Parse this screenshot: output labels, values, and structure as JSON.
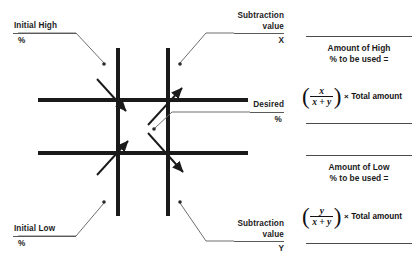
{
  "diagram": {
    "colors": {
      "line": "#1a1a1a",
      "leader": "#6e6e6e",
      "text": "#1c1c1c",
      "rule": "#5a5a5a",
      "background": "#ffffff"
    },
    "callouts": [
      {
        "id": "initial-high",
        "line1": "Initial  High",
        "line2": "%",
        "align": "left"
      },
      {
        "id": "subtraction-value-x",
        "line1": "Subtraction",
        "line2": "value",
        "line3": "X",
        "align": "right"
      },
      {
        "id": "desired",
        "line1": "Desired",
        "line2": "%",
        "align": "right"
      },
      {
        "id": "initial-low",
        "line1": "Initial Low",
        "line2": "%",
        "align": "left"
      },
      {
        "id": "subtraction-value-y",
        "line1": "Subtraction",
        "line2": "value",
        "line3": "Y",
        "align": "right"
      }
    ]
  },
  "panel": {
    "high": {
      "heading_line1": "Amount of High",
      "heading_line2": "% to be used =",
      "formula": {
        "open_paren": "(",
        "numerator": "x",
        "denominator": "x + y",
        "close_paren": ")",
        "times": "×",
        "tail": "Total amount"
      }
    },
    "low": {
      "heading_line1": "Amount of Low",
      "heading_line2": "% to be used =",
      "formula": {
        "open_paren": "(",
        "numerator": "y",
        "denominator": "x + y",
        "close_paren": ")",
        "times": "×",
        "tail": "Total amount"
      }
    }
  }
}
